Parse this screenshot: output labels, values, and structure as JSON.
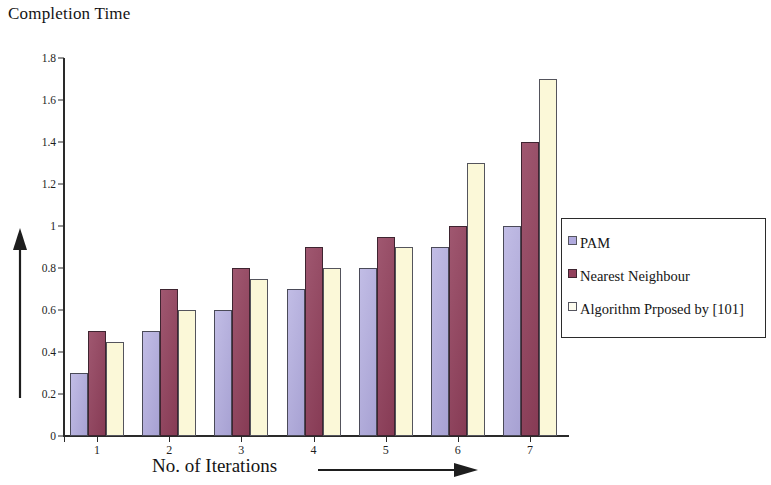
{
  "chart_data": {
    "type": "bar",
    "title": "Completion Time",
    "xlabel": "No. of Iterations",
    "ylabel": "Completion Time",
    "categories": [
      "1",
      "2",
      "3",
      "4",
      "5",
      "6",
      "7"
    ],
    "series": [
      {
        "name": "PAM",
        "color": "#b0aade",
        "values": [
          0.3,
          0.5,
          0.6,
          0.7,
          0.8,
          0.9,
          1.0
        ]
      },
      {
        "name": "Nearest Neighbour",
        "color": "#92405c",
        "values": [
          0.5,
          0.7,
          0.8,
          0.9,
          0.95,
          1.0,
          1.4
        ]
      },
      {
        "name": "Algorithm Prposed by [101]",
        "color": "#fbf8d8",
        "values": [
          0.45,
          0.6,
          0.75,
          0.8,
          0.9,
          1.3,
          1.7
        ]
      }
    ],
    "ylim": [
      0,
      1.8
    ],
    "y_ticks": [
      "0",
      "0.2",
      "0.4",
      "0.6",
      "0.8",
      "1",
      "1.2",
      "1.4",
      "1.6",
      "1.8"
    ],
    "y_tick_values": [
      0,
      0.2,
      0.4,
      0.6,
      0.8,
      1.0,
      1.2,
      1.4,
      1.6,
      1.8
    ],
    "grid": false,
    "legend_position": "right",
    "x_axis_arrow": "right-arrow",
    "y_axis_arrow": "up-arrow"
  },
  "legend": {
    "entries": [
      {
        "label": "PAM"
      },
      {
        "label": "Nearest Neighbour"
      },
      {
        "label": "Algorithm Prposed by [101]"
      }
    ]
  }
}
